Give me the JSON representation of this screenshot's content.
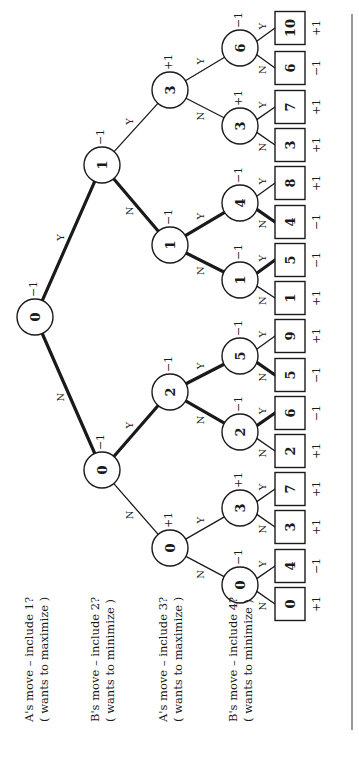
{
  "diagram": {
    "colors": {
      "ink": "#1a1a1a",
      "background": "#ffffff"
    },
    "level_labels": [
      {
        "line1": "A's move – include 1?",
        "line2": "( wants to maximize )",
        "x": 36
      },
      {
        "line1": "B's move – include 2?",
        "line2": "( wants to minimize )",
        "x": 102
      },
      {
        "line1": "A's move – include 3?",
        "line2": "( wants to maximize )",
        "x": 170
      },
      {
        "line1": "B's move – include 4?",
        "line2": "( wants to minimize )",
        "x": 240
      }
    ],
    "nodes": [
      {
        "id": "r",
        "value": "0",
        "score": "−1",
        "x": 35,
        "y": 317
      },
      {
        "id": "a",
        "value": "1",
        "score": "−1",
        "x": 102,
        "y": 165
      },
      {
        "id": "b",
        "value": "0",
        "score": "−1",
        "x": 102,
        "y": 470
      },
      {
        "id": "aa",
        "value": "3",
        "score": "+1",
        "x": 170,
        "y": 90
      },
      {
        "id": "ab",
        "value": "1",
        "score": "−1",
        "x": 170,
        "y": 245
      },
      {
        "id": "ba",
        "value": "2",
        "score": "−1",
        "x": 170,
        "y": 392
      },
      {
        "id": "bb",
        "value": "0",
        "score": "+1",
        "x": 170,
        "y": 548
      },
      {
        "id": "aaa",
        "value": "6",
        "score": "−1",
        "x": 240,
        "y": 48
      },
      {
        "id": "aab",
        "value": "3",
        "score": "+1",
        "x": 240,
        "y": 126
      },
      {
        "id": "aba",
        "value": "4",
        "score": "−1",
        "x": 240,
        "y": 203
      },
      {
        "id": "abb",
        "value": "1",
        "score": "−1",
        "x": 240,
        "y": 280
      },
      {
        "id": "baa",
        "value": "5",
        "score": "−1",
        "x": 240,
        "y": 356
      },
      {
        "id": "bab",
        "value": "2",
        "score": "−1",
        "x": 240,
        "y": 432
      },
      {
        "id": "bba",
        "value": "3",
        "score": "+1",
        "x": 240,
        "y": 508
      },
      {
        "id": "bbb",
        "value": "0",
        "score": "−1",
        "x": 240,
        "y": 585
      }
    ],
    "leaves": [
      {
        "id": "l1",
        "value": "10",
        "score": "+1",
        "y": 28
      },
      {
        "id": "l2",
        "value": "6",
        "score": "−1",
        "y": 68
      },
      {
        "id": "l3",
        "value": "7",
        "score": "+1",
        "y": 107
      },
      {
        "id": "l4",
        "value": "3",
        "score": "+1",
        "y": 145
      },
      {
        "id": "l5",
        "value": "8",
        "score": "+1",
        "y": 183
      },
      {
        "id": "l6",
        "value": "4",
        "score": "−1",
        "y": 222
      },
      {
        "id": "l7",
        "value": "5",
        "score": "−1",
        "y": 260
      },
      {
        "id": "l8",
        "value": "1",
        "score": "+1",
        "y": 298
      },
      {
        "id": "l9",
        "value": "9",
        "score": "+1",
        "y": 336
      },
      {
        "id": "l10",
        "value": "5",
        "score": "−1",
        "y": 375
      },
      {
        "id": "l11",
        "value": "6",
        "score": "−1",
        "y": 413
      },
      {
        "id": "l12",
        "value": "2",
        "score": "+1",
        "y": 451
      },
      {
        "id": "l13",
        "value": "7",
        "score": "+1",
        "y": 489
      },
      {
        "id": "l14",
        "value": "3",
        "score": "+1",
        "y": 527
      },
      {
        "id": "l15",
        "value": "4",
        "score": "−1",
        "y": 566
      },
      {
        "id": "l16",
        "value": "0",
        "score": "+1",
        "y": 604
      }
    ],
    "leaf_x": 290,
    "edges": [
      {
        "from": "r",
        "to": "a",
        "label": "Y",
        "bold": true
      },
      {
        "from": "r",
        "to": "b",
        "label": "N",
        "bold": true
      },
      {
        "from": "a",
        "to": "aa",
        "label": "Y",
        "bold": false
      },
      {
        "from": "a",
        "to": "ab",
        "label": "N",
        "bold": true
      },
      {
        "from": "b",
        "to": "ba",
        "label": "Y",
        "bold": true
      },
      {
        "from": "b",
        "to": "bb",
        "label": "N",
        "bold": false
      },
      {
        "from": "aa",
        "to": "aaa",
        "label": "Y",
        "bold": false
      },
      {
        "from": "aa",
        "to": "aab",
        "label": "N",
        "bold": false
      },
      {
        "from": "ab",
        "to": "aba",
        "label": "Y",
        "bold": true
      },
      {
        "from": "ab",
        "to": "abb",
        "label": "N",
        "bold": true
      },
      {
        "from": "ba",
        "to": "baa",
        "label": "Y",
        "bold": true
      },
      {
        "from": "ba",
        "to": "bab",
        "label": "N",
        "bold": true
      },
      {
        "from": "bb",
        "to": "bba",
        "label": "Y",
        "bold": false
      },
      {
        "from": "bb",
        "to": "bbb",
        "label": "N",
        "bold": false
      },
      {
        "from": "aaa",
        "to": "l1",
        "label": "Y",
        "bold": false
      },
      {
        "from": "aaa",
        "to": "l2",
        "label": "N",
        "bold": false
      },
      {
        "from": "aab",
        "to": "l3",
        "label": "Y",
        "bold": false
      },
      {
        "from": "aab",
        "to": "l4",
        "label": "N",
        "bold": false
      },
      {
        "from": "aba",
        "to": "l5",
        "label": "Y",
        "bold": false
      },
      {
        "from": "aba",
        "to": "l6",
        "label": "N",
        "bold": true
      },
      {
        "from": "abb",
        "to": "l7",
        "label": "Y",
        "bold": true
      },
      {
        "from": "abb",
        "to": "l8",
        "label": "N",
        "bold": false
      },
      {
        "from": "baa",
        "to": "l9",
        "label": "Y",
        "bold": false
      },
      {
        "from": "baa",
        "to": "l10",
        "label": "N",
        "bold": true
      },
      {
        "from": "bab",
        "to": "l11",
        "label": "Y",
        "bold": true
      },
      {
        "from": "bab",
        "to": "l12",
        "label": "N",
        "bold": false
      },
      {
        "from": "bba",
        "to": "l13",
        "label": "Y",
        "bold": false
      },
      {
        "from": "bba",
        "to": "l14",
        "label": "N",
        "bold": false
      },
      {
        "from": "bbb",
        "to": "l15",
        "label": "Y",
        "bold": false
      },
      {
        "from": "bbb",
        "to": "l16",
        "label": "N",
        "bold": false
      }
    ],
    "rule_line": {
      "x": 352,
      "y1": 14,
      "y2": 730
    }
  }
}
